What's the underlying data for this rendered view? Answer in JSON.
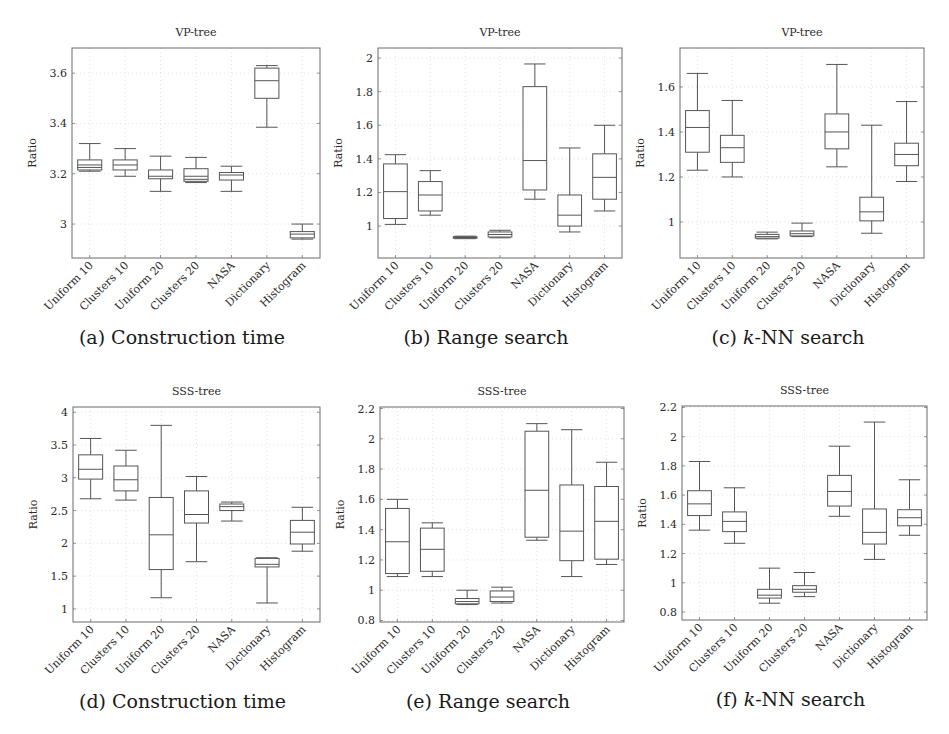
{
  "figure": {
    "categories": [
      "Uniform 10",
      "Clusters 10",
      "Uniform 20",
      "Clusters 20",
      "NASA",
      "Dictionary",
      "Histogram"
    ]
  },
  "chart_data": [
    {
      "id": "a",
      "type": "box",
      "title": "VP-tree",
      "caption": "(a) Construction time",
      "caption_prefix": "(a) ",
      "caption_italic": "",
      "caption_rest": "Construction time",
      "xlabel": "",
      "ylabel": "Ratio",
      "ylim": [
        2.865,
        3.7
      ],
      "yticks": [
        3.0,
        3.2,
        3.4,
        3.6
      ],
      "ytick_labels": [
        "3",
        "3.2",
        "3.4",
        "3.6"
      ],
      "frame": {
        "x0": 72,
        "x1": 320,
        "y0": 48,
        "y1": 258
      },
      "categories": [
        "Uniform 10",
        "Clusters 10",
        "Uniform 20",
        "Clusters 20",
        "NASA",
        "Dictionary",
        "Histogram"
      ],
      "boxes": [
        {
          "min": 3.21,
          "q1": 3.215,
          "median": 3.235,
          "q3": 3.255,
          "max": 3.32,
          "extra_lines": [
            3.225
          ]
        },
        {
          "min": 3.19,
          "q1": 3.215,
          "median": 3.235,
          "q3": 3.255,
          "max": 3.3
        },
        {
          "min": 3.13,
          "q1": 3.18,
          "median": 3.19,
          "q3": 3.215,
          "max": 3.27
        },
        {
          "min": 3.165,
          "q1": 3.17,
          "median": 3.19,
          "q3": 3.22,
          "max": 3.265,
          "extra_lines": [
            3.178
          ]
        },
        {
          "min": 3.13,
          "q1": 3.175,
          "median": 3.195,
          "q3": 3.205,
          "max": 3.23
        },
        {
          "min": 3.385,
          "q1": 3.5,
          "median": 3.57,
          "q3": 3.62,
          "max": 3.63
        },
        {
          "min": 2.94,
          "q1": 2.945,
          "median": 2.96,
          "q3": 2.97,
          "max": 3.0
        }
      ]
    },
    {
      "id": "b",
      "type": "box",
      "title": "VP-tree",
      "caption": "(b) Range search",
      "caption_prefix": "(b) ",
      "caption_italic": "",
      "caption_rest": "Range search",
      "xlabel": "",
      "ylabel": "Ratio",
      "ylim": [
        0.81,
        2.06
      ],
      "yticks": [
        1.0,
        1.2,
        1.4,
        1.6,
        1.8,
        2.0
      ],
      "ytick_labels": [
        "1",
        "1.2",
        "1.4",
        "1.6",
        "1.8",
        "2"
      ],
      "frame": {
        "x0": 378,
        "x1": 622,
        "y0": 48,
        "y1": 258
      },
      "categories": [
        "Uniform 10",
        "Clusters 10",
        "Uniform 20",
        "Clusters 20",
        "NASA",
        "Dictionary",
        "Histogram"
      ],
      "boxes": [
        {
          "min": 1.01,
          "q1": 1.045,
          "median": 1.205,
          "q3": 1.37,
          "max": 1.425
        },
        {
          "min": 1.065,
          "q1": 1.09,
          "median": 1.185,
          "q3": 1.265,
          "max": 1.33
        },
        {
          "min": 0.925,
          "q1": 0.928,
          "median": 0.932,
          "q3": 0.937,
          "max": 0.94
        },
        {
          "min": 0.93,
          "q1": 0.935,
          "median": 0.95,
          "q3": 0.965,
          "max": 0.975
        },
        {
          "min": 1.16,
          "q1": 1.215,
          "median": 1.39,
          "q3": 1.83,
          "max": 1.965
        },
        {
          "min": 0.965,
          "q1": 1.0,
          "median": 1.065,
          "q3": 1.185,
          "max": 1.465
        },
        {
          "min": 1.09,
          "q1": 1.16,
          "median": 1.29,
          "q3": 1.43,
          "max": 1.6
        }
      ]
    },
    {
      "id": "c",
      "type": "box",
      "title": "VP-tree",
      "caption": "(c) k-NN search",
      "caption_prefix": "(c) ",
      "caption_italic": "k",
      "caption_rest": "-NN search",
      "xlabel": "",
      "ylabel": "Ratio",
      "ylim": [
        0.84,
        1.773
      ],
      "yticks": [
        1.0,
        1.2,
        1.4,
        1.6
      ],
      "ytick_labels": [
        "1",
        "1.2",
        "1.4",
        "1.6"
      ],
      "frame": {
        "x0": 680,
        "x1": 924,
        "y0": 48,
        "y1": 258
      },
      "categories": [
        "Uniform 10",
        "Clusters 10",
        "Uniform 20",
        "Clusters 20",
        "NASA",
        "Dictionary",
        "Histogram"
      ],
      "boxes": [
        {
          "min": 1.23,
          "q1": 1.31,
          "median": 1.42,
          "q3": 1.495,
          "max": 1.66
        },
        {
          "min": 1.2,
          "q1": 1.265,
          "median": 1.33,
          "q3": 1.385,
          "max": 1.54
        },
        {
          "min": 0.925,
          "q1": 0.928,
          "median": 0.935,
          "q3": 0.945,
          "max": 0.955
        },
        {
          "min": 0.935,
          "q1": 0.938,
          "median": 0.948,
          "q3": 0.96,
          "max": 0.995
        },
        {
          "min": 1.245,
          "q1": 1.325,
          "median": 1.4,
          "q3": 1.48,
          "max": 1.7
        },
        {
          "min": 0.95,
          "q1": 1.005,
          "median": 1.045,
          "q3": 1.11,
          "max": 1.43
        },
        {
          "min": 1.18,
          "q1": 1.25,
          "median": 1.3,
          "q3": 1.35,
          "max": 1.535
        }
      ]
    },
    {
      "id": "d",
      "type": "box",
      "title": "SSS-tree",
      "caption": "(d) Construction time",
      "caption_prefix": "(d) ",
      "caption_italic": "",
      "caption_rest": "Construction time",
      "xlabel": "",
      "ylabel": "Ratio",
      "ylim": [
        0.8,
        4.08
      ],
      "yticks": [
        1.0,
        1.5,
        2.0,
        2.5,
        3.0,
        3.5,
        4.0
      ],
      "ytick_labels": [
        "1",
        "1.5",
        "2",
        "2.5",
        "3",
        "3.5",
        "4"
      ],
      "frame": {
        "x0": 73,
        "x1": 320,
        "y0": 407,
        "y1": 622
      },
      "categories": [
        "Uniform 10",
        "Clusters 10",
        "Uniform 20",
        "Clusters 20",
        "NASA",
        "Dictionary",
        "Histogram"
      ],
      "boxes": [
        {
          "min": 2.68,
          "q1": 2.98,
          "median": 3.13,
          "q3": 3.35,
          "max": 3.6
        },
        {
          "min": 2.66,
          "q1": 2.8,
          "median": 2.97,
          "q3": 3.18,
          "max": 3.42
        },
        {
          "min": 1.17,
          "q1": 1.6,
          "median": 2.13,
          "q3": 2.7,
          "max": 3.8
        },
        {
          "min": 1.72,
          "q1": 2.31,
          "median": 2.44,
          "q3": 2.8,
          "max": 3.02
        },
        {
          "min": 2.34,
          "q1": 2.5,
          "median": 2.56,
          "q3": 2.6,
          "max": 2.63
        },
        {
          "min": 1.09,
          "q1": 1.64,
          "median": 1.68,
          "q3": 1.77,
          "max": 1.78
        },
        {
          "min": 1.88,
          "q1": 1.99,
          "median": 2.17,
          "q3": 2.35,
          "max": 2.55
        }
      ]
    },
    {
      "id": "e",
      "type": "box",
      "title": "SSS-tree",
      "caption": "(e) Range search",
      "caption_prefix": "(e) ",
      "caption_italic": "",
      "caption_rest": "Range search",
      "xlabel": "",
      "ylabel": "Ratio",
      "ylim": [
        0.79,
        2.21
      ],
      "yticks": [
        0.8,
        1.0,
        1.2,
        1.4,
        1.6,
        1.8,
        2.0,
        2.2
      ],
      "ytick_labels": [
        "0.8",
        "1",
        "1.2",
        "1.4",
        "1.6",
        "1.8",
        "2",
        "2.2"
      ],
      "frame": {
        "x0": 380,
        "x1": 624,
        "y0": 407,
        "y1": 622
      },
      "categories": [
        "Uniform 10",
        "Clusters 10",
        "Uniform 20",
        "Clusters 20",
        "NASA",
        "Dictionary",
        "Histogram"
      ],
      "boxes": [
        {
          "min": 1.09,
          "q1": 1.11,
          "median": 1.32,
          "q3": 1.54,
          "max": 1.6
        },
        {
          "min": 1.09,
          "q1": 1.125,
          "median": 1.27,
          "q3": 1.41,
          "max": 1.445
        },
        {
          "min": 0.905,
          "q1": 0.91,
          "median": 0.925,
          "q3": 0.945,
          "max": 1.0
        },
        {
          "min": 0.915,
          "q1": 0.925,
          "median": 0.955,
          "q3": 0.995,
          "max": 1.02
        },
        {
          "min": 1.33,
          "q1": 1.35,
          "median": 1.66,
          "q3": 2.05,
          "max": 2.1
        },
        {
          "min": 1.09,
          "q1": 1.195,
          "median": 1.39,
          "q3": 1.695,
          "max": 2.06
        },
        {
          "min": 1.17,
          "q1": 1.205,
          "median": 1.455,
          "q3": 1.685,
          "max": 1.845
        }
      ]
    },
    {
      "id": "f",
      "type": "box",
      "title": "SSS-tree",
      "caption": "(f) k-NN search",
      "caption_prefix": "(f) ",
      "caption_italic": "k",
      "caption_rest": "-NN search",
      "xlabel": "",
      "ylabel": "Ratio",
      "ylim": [
        0.745,
        2.21
      ],
      "yticks": [
        0.8,
        1.0,
        1.2,
        1.4,
        1.6,
        1.8,
        2.0,
        2.2
      ],
      "ytick_labels": [
        "0.8",
        "1",
        "1.2",
        "1.4",
        "1.6",
        "1.8",
        "2",
        "2.2"
      ],
      "frame": {
        "x0": 682,
        "x1": 927,
        "y0": 406,
        "y1": 620
      },
      "categories": [
        "Uniform 10",
        "Clusters 10",
        "Uniform 20",
        "Clusters 20",
        "NASA",
        "Dictionary",
        "Histogram"
      ],
      "boxes": [
        {
          "min": 1.36,
          "q1": 1.46,
          "median": 1.54,
          "q3": 1.63,
          "max": 1.83
        },
        {
          "min": 1.27,
          "q1": 1.35,
          "median": 1.42,
          "q3": 1.485,
          "max": 1.65
        },
        {
          "min": 0.86,
          "q1": 0.895,
          "median": 0.915,
          "q3": 0.955,
          "max": 1.1
        },
        {
          "min": 0.905,
          "q1": 0.935,
          "median": 0.955,
          "q3": 0.98,
          "max": 1.07
        },
        {
          "min": 1.455,
          "q1": 1.525,
          "median": 1.625,
          "q3": 1.735,
          "max": 1.935
        },
        {
          "min": 1.16,
          "q1": 1.265,
          "median": 1.345,
          "q3": 1.505,
          "max": 2.1
        },
        {
          "min": 1.325,
          "q1": 1.39,
          "median": 1.445,
          "q3": 1.5,
          "max": 1.705
        }
      ]
    }
  ]
}
